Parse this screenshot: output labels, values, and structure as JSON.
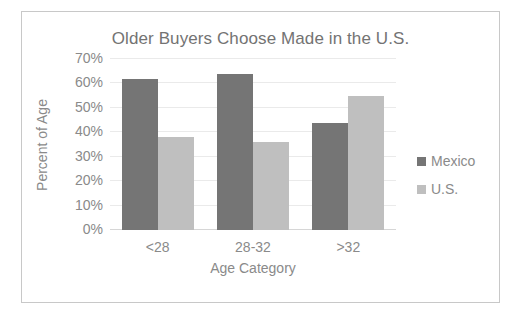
{
  "chart_data": {
    "type": "bar",
    "title": "Older Buyers Choose Made in the U.S.",
    "xlabel": "Age Category",
    "ylabel": "Percent of Age",
    "categories": [
      "<28",
      "28-32",
      ">32"
    ],
    "series": [
      {
        "name": "Mexico",
        "color": "#757575",
        "values": [
          62,
          64,
          44
        ]
      },
      {
        "name": "U.S.",
        "color": "#bfbfbf",
        "values": [
          38,
          36,
          55
        ]
      }
    ],
    "ylim": [
      0,
      70
    ],
    "ytick_step": 10,
    "ytick_labels": [
      "0%",
      "10%",
      "20%",
      "30%",
      "40%",
      "50%",
      "60%",
      "70%"
    ],
    "ytick_values": [
      0,
      10,
      20,
      30,
      40,
      50,
      60,
      70
    ],
    "grid": true,
    "legend_position": "right",
    "legend_entries": [
      "Mexico",
      "U.S."
    ]
  },
  "style": {
    "text_color": "#8a8a8a",
    "title_color": "#737373",
    "grid_color": "#eaeaea",
    "axis_color": "#d6d6d6",
    "frame_color": "#c8c8c8",
    "background": "#ffffff"
  }
}
